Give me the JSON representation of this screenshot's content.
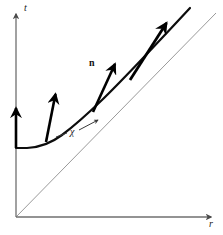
{
  "figure": {
    "background_color": "#ffffff",
    "width": 223,
    "height": 235
  },
  "axes": {
    "vertical": {
      "label": "t",
      "name": "time-axis",
      "color": "#6f6f6f",
      "origin": [
        16,
        217
      ],
      "tip": [
        16,
        12
      ],
      "arrowhead": "up"
    },
    "horizontal": {
      "label": "r",
      "name": "radial-axis",
      "color": "#6f6f6f",
      "origin": [
        16,
        217
      ],
      "tip": [
        213,
        217
      ],
      "arrowhead": "right"
    }
  },
  "lightcone": {
    "label": "",
    "name": "light-cone-line",
    "color": "#9a9a9a",
    "width": 1,
    "from": [
      16,
      217
    ],
    "to": [
      216,
      13
    ],
    "slope_degrees": 45
  },
  "curve": {
    "name": "hypersurface-worldline",
    "color": "#0d0d0d",
    "width": 2.2,
    "description": "hyperbola-like curve, flat at left then asymptotic to the 45 degree light cone",
    "points": [
      [
        16,
        148
      ],
      [
        26,
        148
      ],
      [
        38,
        146
      ],
      [
        50,
        142
      ],
      [
        62,
        135
      ],
      [
        74,
        126
      ],
      [
        88,
        114
      ],
      [
        102,
        100
      ],
      [
        116,
        86
      ],
      [
        130,
        72
      ],
      [
        146,
        55
      ],
      [
        162,
        38
      ],
      [
        178,
        21
      ],
      [
        190,
        8
      ]
    ]
  },
  "normal_vectors": {
    "label": "n",
    "label_position": [
      89,
      58
    ],
    "color": "#000000",
    "width": 2.6,
    "count": 4,
    "arrows": [
      {
        "name": "normal-vector-1",
        "from": [
          16,
          148
        ],
        "to": [
          16,
          106
        ]
      },
      {
        "name": "normal-vector-2",
        "from": [
          46,
          142
        ],
        "to": [
          56,
          92
        ]
      },
      {
        "name": "normal-vector-3",
        "from": [
          93,
          112
        ],
        "to": [
          116,
          62
        ]
      },
      {
        "name": "normal-vector-4",
        "from": [
          130,
          80
        ],
        "to": [
          168,
          21
        ]
      }
    ]
  },
  "chi_annotation": {
    "label": "χ",
    "name": "chi-tangent-annotation",
    "color": "#3a3a3a",
    "width": 1,
    "style": "dashed-tangent-arrow",
    "from": [
      57,
      137
    ],
    "to": [
      99,
      120
    ],
    "label_position": [
      70,
      127
    ]
  },
  "colors": {
    "ink": "#0d0d0d",
    "axis": "#6f6f6f",
    "lightcone": "#9a9a9a",
    "annotation": "#3a3a3a",
    "background": "#ffffff"
  }
}
